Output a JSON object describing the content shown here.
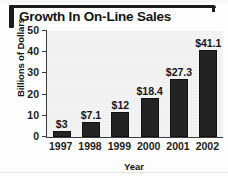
{
  "chart_data": {
    "type": "bar",
    "title": "Growth In On-Line Sales",
    "xlabel": "Year",
    "ylabel": "Billions of Dollars",
    "categories": [
      "1997",
      "1998",
      "1999",
      "2000",
      "2001",
      "2002"
    ],
    "values": [
      3,
      7.1,
      12,
      18.4,
      27.3,
      41.1
    ],
    "data_labels": [
      "$3",
      "$7.1",
      "$12",
      "$18.4",
      "$27.3",
      "$41.1"
    ],
    "ylim": [
      0,
      50
    ],
    "yticks": [
      0,
      10,
      20,
      30,
      40,
      50
    ],
    "ytick_labels": [
      "0",
      "10",
      "20",
      "30",
      "40",
      "50"
    ],
    "grid": false,
    "legend": null,
    "bar_color": "#232323",
    "plot_background": "#f3f3f3",
    "text_color": "#141414"
  }
}
